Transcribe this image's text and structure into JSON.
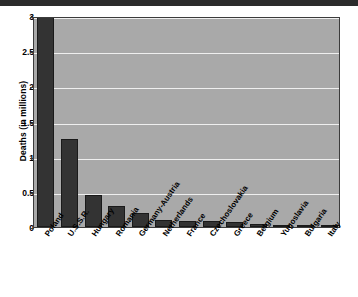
{
  "chart_data": {
    "type": "bar",
    "title": "",
    "xlabel": "",
    "ylabel": "Deaths (in millions)",
    "ylim": [
      0,
      3
    ],
    "yticks": [
      "0",
      "0.5",
      "1",
      "1.5",
      "2",
      "2.5",
      "3"
    ],
    "ytick_values": [
      0,
      0.5,
      1,
      1.5,
      2,
      2.5,
      3
    ],
    "grid": true,
    "legend": "none",
    "categories": [
      "Poland",
      "U.S.S.R.",
      "Hungary",
      "Romania",
      "Germany-Austria",
      "Netherlands",
      "France",
      "Czechoslovakia",
      "Greece",
      "Belgium",
      "Yugoslavia",
      "Bulgaria",
      "Italy"
    ],
    "values": [
      3.0,
      1.25,
      0.45,
      0.3,
      0.2,
      0.105,
      0.083,
      0.08,
      0.065,
      0.04,
      0.032,
      0.014,
      0.008
    ],
    "bar_color": "#333333",
    "plot_background": "#a9a9a9",
    "gridline_color": "#efefef",
    "axis_color": "#3c3c3c"
  }
}
